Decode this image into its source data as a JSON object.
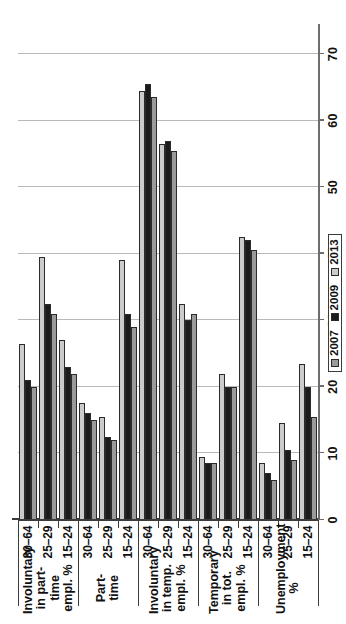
{
  "chart_data": {
    "type": "bar",
    "orientation": "horizontal",
    "title": "",
    "xlabel": "",
    "ylabel": "",
    "xlim": [
      0,
      70
    ],
    "xticks": [
      0,
      10,
      20,
      30,
      40,
      50,
      60,
      70
    ],
    "xtick_labels": [
      "0",
      "10",
      "20",
      "30",
      "40",
      "50",
      "60",
      "70"
    ],
    "grid": true,
    "legend_position": "bottom-right",
    "age_groups": [
      "15–24",
      "25–29",
      "30–64"
    ],
    "series_names": [
      "2007",
      "2009",
      "2013"
    ],
    "series_colors": {
      "2007": "#9a9a9a",
      "2009": "#1b1b1b",
      "2013": "#cbcbcb"
    },
    "groups": [
      {
        "label": "Unemployment %",
        "categories": [
          {
            "age": "15–24",
            "values": {
              "2007": 15.5,
              "2009": 20.0,
              "2013": 23.5
            }
          },
          {
            "age": "25–29",
            "values": {
              "2007": 9.0,
              "2009": 10.5,
              "2013": 14.5
            }
          },
          {
            "age": "30–64",
            "values": {
              "2007": 6.0,
              "2009": 7.0,
              "2013": 8.5
            }
          }
        ]
      },
      {
        "label": "Temporary in tot. empl. %",
        "categories": [
          {
            "age": "15–24",
            "values": {
              "2007": 40.5,
              "2009": 42.0,
              "2013": 42.5
            }
          },
          {
            "age": "25–29",
            "values": {
              "2007": 20.0,
              "2009": 20.0,
              "2013": 22.0
            }
          },
          {
            "age": "30–64",
            "values": {
              "2007": 8.5,
              "2009": 8.5,
              "2013": 9.5
            }
          }
        ]
      },
      {
        "label": "Involuntary in temp. empl. %",
        "categories": [
          {
            "age": "15–24",
            "values": {
              "2007": 31.0,
              "2009": 30.0,
              "2013": 32.5
            }
          },
          {
            "age": "25–29",
            "values": {
              "2007": 55.5,
              "2009": 57.0,
              "2013": 56.5
            }
          },
          {
            "age": "30–64",
            "values": {
              "2007": 63.5,
              "2009": 65.5,
              "2013": 64.5
            }
          }
        ]
      },
      {
        "label": "Part-time",
        "categories": [
          {
            "age": "15–24",
            "values": {
              "2007": 29.0,
              "2009": 31.0,
              "2013": 39.0
            }
          },
          {
            "age": "25–29",
            "values": {
              "2007": 12.0,
              "2009": 12.5,
              "2013": 15.5
            }
          },
          {
            "age": "30–64",
            "values": {
              "2007": 15.0,
              "2009": 16.0,
              "2013": 17.5
            }
          }
        ]
      },
      {
        "label": "Involuntary in part-time empl. %",
        "categories": [
          {
            "age": "15–24",
            "values": {
              "2007": 22.0,
              "2009": 23.0,
              "2013": 27.0
            }
          },
          {
            "age": "25–29",
            "values": {
              "2007": 31.0,
              "2009": 32.5,
              "2013": 39.5
            }
          },
          {
            "age": "30–64",
            "values": {
              "2007": 20.0,
              "2009": 21.0,
              "2013": 26.5
            }
          }
        ]
      }
    ]
  },
  "legend": {
    "items": [
      {
        "label": "2007",
        "color": "#9a9a9a"
      },
      {
        "label": "2009",
        "color": "#1b1b1b"
      },
      {
        "label": "2013",
        "color": "#cbcbcb"
      }
    ]
  }
}
